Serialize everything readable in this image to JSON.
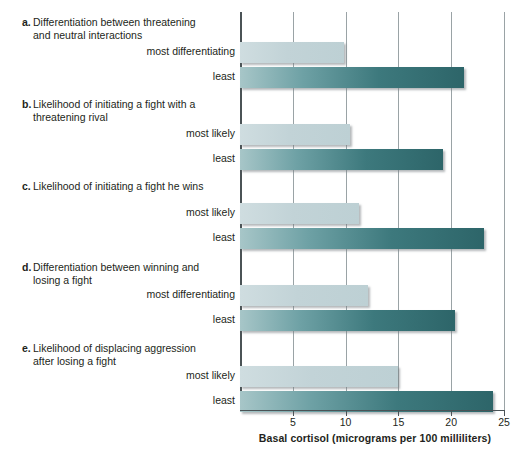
{
  "chart_data": {
    "type": "bar",
    "orientation": "horizontal",
    "title": "",
    "xlabel": "Basal cortisol (micrograms per 100 milliliters)",
    "ylabel": "",
    "xlim": [
      0,
      25
    ],
    "xticks": [
      5,
      10,
      15,
      20,
      25
    ],
    "grid": true,
    "legend": "none",
    "panels": [
      {
        "letter": "a.",
        "title": "Differentiation between threatening and neutral interactions",
        "categories": [
          "most differentiating",
          "least"
        ],
        "values": [
          9.8,
          21.2
        ],
        "styles": [
          "light",
          "dark"
        ]
      },
      {
        "letter": "b.",
        "title": "Likelihood of initiating a fight with a threatening rival",
        "categories": [
          "most likely",
          "least"
        ],
        "values": [
          10.4,
          19.2
        ],
        "styles": [
          "light",
          "dark"
        ]
      },
      {
        "letter": "c.",
        "title": "Likelihood of initiating a fight he wins",
        "categories": [
          "most likely",
          "least"
        ],
        "values": [
          11.3,
          23.1
        ],
        "styles": [
          "light",
          "dark"
        ]
      },
      {
        "letter": "d.",
        "title": "Differentiation between winning and losing a fight",
        "categories": [
          "most differentiating",
          "least"
        ],
        "values": [
          12.1,
          20.4
        ],
        "styles": [
          "light",
          "dark"
        ]
      },
      {
        "letter": "e.",
        "title": "Likelihood of displacing aggression after losing a fight",
        "categories": [
          "most likely",
          "least"
        ],
        "values": [
          15.0,
          24.0
        ],
        "styles": [
          "light",
          "dark"
        ]
      }
    ]
  },
  "colors": {
    "bar_light_start": "#cfdde0",
    "bar_light_end": "#bdd0d4",
    "bar_dark_start": "#a7c6c8",
    "bar_dark_end": "#2d6569",
    "gridline": "#9aa3a6",
    "axis": "#4b5356",
    "text": "#231f20",
    "background": "#ffffff"
  },
  "axis": {
    "tick_labels": [
      "5",
      "10",
      "15",
      "20",
      "25"
    ],
    "title": "Basal cortisol (micrograms per 100 milliliters)"
  },
  "panel_a": {
    "letter": "a.",
    "line1": "Differentiation between threatening",
    "line2": "and neutral interactions",
    "cat1": "most differentiating",
    "cat2": "least"
  },
  "panel_b": {
    "letter": "b.",
    "line1": "Likelihood of initiating a fight with a",
    "line2": "threatening rival",
    "cat1": "most likely",
    "cat2": "least"
  },
  "panel_c": {
    "letter": "c.",
    "line1": "Likelihood of initiating a fight he wins",
    "line2": "",
    "cat1": "most likely",
    "cat2": "least"
  },
  "panel_d": {
    "letter": "d.",
    "line1": "Differentiation between winning and",
    "line2": "losing a fight",
    "cat1": "most differentiating",
    "cat2": "least"
  },
  "panel_e": {
    "letter": "e.",
    "line1": "Likelihood of displacing aggression",
    "line2": "after losing a fight",
    "cat1": "most likely",
    "cat2": "least"
  }
}
